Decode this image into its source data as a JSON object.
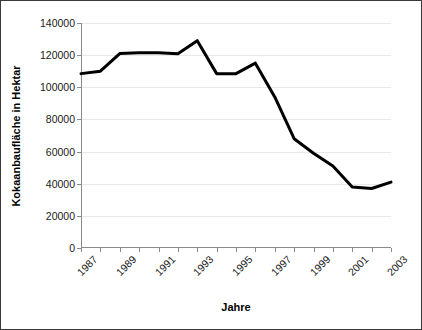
{
  "chart_data": {
    "type": "line",
    "title": "",
    "xlabel": "Jahre",
    "ylabel": "Kokaanbaufläche in Hektar",
    "x": [
      1987,
      1988,
      1989,
      1990,
      1991,
      1992,
      1993,
      1994,
      1995,
      1996,
      1997,
      1998,
      1999,
      2000,
      2001,
      2002,
      2003
    ],
    "values": [
      108500,
      110000,
      121000,
      121500,
      121500,
      120800,
      129000,
      108500,
      108500,
      115000,
      94000,
      68000,
      59000,
      51000,
      38000,
      37000,
      41000
    ],
    "series": [
      {
        "name": "Kokaanbaufläche",
        "values": [
          108500,
          110000,
          121000,
          121500,
          121500,
          120800,
          129000,
          108500,
          108500,
          115000,
          94000,
          68000,
          59000,
          51000,
          38000,
          37000,
          41000
        ]
      }
    ],
    "xlim": [
      1987,
      2003
    ],
    "ylim": [
      0,
      140000
    ],
    "yticks": [
      0,
      20000,
      40000,
      60000,
      80000,
      100000,
      120000,
      140000
    ],
    "ytick_labels": [
      "0",
      "20000",
      "40000",
      "60000",
      "80000",
      "100000",
      "120000",
      "140000"
    ],
    "xticks": [
      1987,
      1989,
      1991,
      1993,
      1995,
      1997,
      1999,
      2001,
      2003
    ],
    "xtick_labels": [
      "1987",
      "1989",
      "1991",
      "1993",
      "1995",
      "1997",
      "1999",
      "2001",
      "2003"
    ],
    "grid": true,
    "grid_axis": "y",
    "legend": false,
    "line_color": "#000000",
    "line_width": 3,
    "markers": false,
    "border_color": "#3a3a3a",
    "gridline_color": "#e9e9e9",
    "axis_color": "#8a8a8a",
    "background": "#ffffff"
  }
}
